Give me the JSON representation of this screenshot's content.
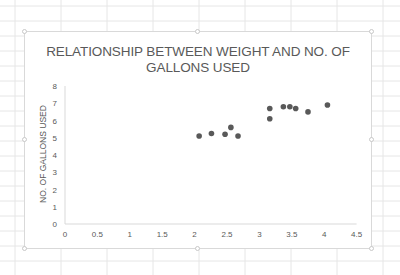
{
  "chart_data": {
    "type": "scatter",
    "title": "RELATIONSHIP BETWEEN WEIGHT AND NO. OF GALLONS USED",
    "title_lines": [
      "RELATIONSHIP BETWEEN WEIGHT AND NO. OF",
      "GALLONS USED"
    ],
    "xlabel": "",
    "ylabel": "NO. OF GALLONS USED",
    "xlim": [
      0,
      4.5
    ],
    "ylim": [
      0,
      8
    ],
    "x_ticks": [
      "0",
      "0.5",
      "1",
      "1.5",
      "2",
      "2.5",
      "3",
      "3.5",
      "4",
      "4.5"
    ],
    "y_ticks": [
      "0",
      "1",
      "2",
      "3",
      "4",
      "5",
      "6",
      "7",
      "8"
    ],
    "grid": false,
    "legend": null,
    "series": [
      {
        "name": "Series1",
        "color": "#595959",
        "points": [
          {
            "x": 2.07,
            "y": 5.1
          },
          {
            "x": 2.26,
            "y": 5.25
          },
          {
            "x": 2.47,
            "y": 5.2
          },
          {
            "x": 2.56,
            "y": 5.6
          },
          {
            "x": 2.67,
            "y": 5.1
          },
          {
            "x": 3.16,
            "y": 6.7
          },
          {
            "x": 3.16,
            "y": 6.1
          },
          {
            "x": 3.37,
            "y": 6.8
          },
          {
            "x": 3.47,
            "y": 6.8
          },
          {
            "x": 3.56,
            "y": 6.7
          },
          {
            "x": 3.75,
            "y": 6.5
          },
          {
            "x": 4.05,
            "y": 6.9
          }
        ]
      }
    ]
  },
  "colors": {
    "text": "#595959",
    "marker": "#595959",
    "axis": "#d9d9d9",
    "sheet_grid": "#e6e6e6"
  }
}
